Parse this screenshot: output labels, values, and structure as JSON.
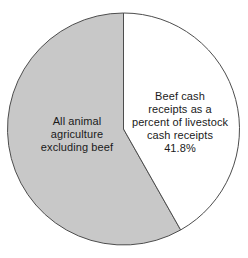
{
  "chart_data": {
    "type": "pie",
    "title": "",
    "subtitle": "",
    "xlabel": "",
    "ylabel": "",
    "grid": false,
    "legend_position": "none",
    "units": "percent",
    "total": 100.0,
    "start_angle_deg": 0,
    "direction": "clockwise",
    "categories": [
      "Beef cash receipts as a percent of livestock cash receipts",
      "All animal agriculture excluding beef"
    ],
    "values": [
      41.8,
      58.2
    ],
    "value_labels": [
      "41.8%",
      ""
    ],
    "slices": [
      {
        "name": "beef-cash-receipts",
        "value": 41.8,
        "value_label": "41.8%",
        "fill": "#ffffff",
        "stroke": "#4d4d4d",
        "label_lines": [
          "Beef cash",
          "receipts as a",
          "percent of livestock",
          "cash receipts",
          "41.8%"
        ]
      },
      {
        "name": "all-animal-agriculture-excluding-beef",
        "value": 58.2,
        "value_label": "",
        "fill": "#c8c8c8",
        "stroke": "#4d4d4d",
        "label_lines": [
          "All animal",
          "agriculture",
          "excluding beef"
        ]
      }
    ]
  },
  "colors": {
    "background": "#ffffff",
    "slice_gray": "#c8c8c8",
    "slice_white": "#ffffff",
    "outline": "#4d4d4d",
    "text": "#1a1a1a"
  },
  "geometry": {
    "center_x": 123.5,
    "center_y": 129,
    "radius": 116
  },
  "labels": {
    "white_slice": {
      "l1": "Beef cash",
      "l2": "receipts as a",
      "l3": "percent of livestock",
      "l4": "cash receipts",
      "l5": "41.8%"
    },
    "gray_slice": {
      "l1": "All animal",
      "l2": "agriculture",
      "l3": "excluding beef"
    }
  }
}
